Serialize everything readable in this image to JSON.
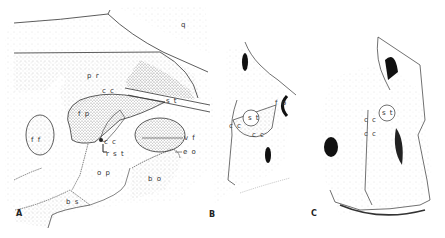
{
  "figure": {
    "panels": [
      {
        "id": "A",
        "label": "A",
        "labels": [
          {
            "text": "q",
            "x": 181,
            "y": 22
          },
          {
            "text": "p r",
            "x": 87,
            "y": 73
          },
          {
            "text": "c c",
            "x": 102,
            "y": 88
          },
          {
            "text": "s t",
            "x": 166,
            "y": 98
          },
          {
            "text": "f p",
            "x": 78,
            "y": 111
          },
          {
            "text": "f f",
            "x": 31,
            "y": 137
          },
          {
            "text": "c c",
            "x": 104,
            "y": 139
          },
          {
            "text": "r s t",
            "x": 106,
            "y": 151
          },
          {
            "text": "v f",
            "x": 184,
            "y": 135
          },
          {
            "text": "e o",
            "x": 183,
            "y": 149
          },
          {
            "text": "o p",
            "x": 97,
            "y": 170
          },
          {
            "text": "b o",
            "x": 148,
            "y": 176
          },
          {
            "text": "b s",
            "x": 66,
            "y": 199
          }
        ]
      },
      {
        "id": "B",
        "label": "B",
        "labels": [
          {
            "text": "f p",
            "x": 275,
            "y": 100
          },
          {
            "text": "s t",
            "x": 248,
            "y": 115
          },
          {
            "text": "c c",
            "x": 229,
            "y": 123
          },
          {
            "text": "c c",
            "x": 252,
            "y": 132
          }
        ]
      },
      {
        "id": "C",
        "label": "C",
        "labels": [
          {
            "text": "s t",
            "x": 386,
            "y": 111
          },
          {
            "text": "c c",
            "x": 364,
            "y": 117
          },
          {
            "text": "c c",
            "x": 364,
            "y": 131
          }
        ]
      }
    ],
    "panel_label_positions": {
      "A": {
        "x": 16,
        "y": 210
      },
      "B": {
        "x": 209,
        "y": 211
      },
      "C": {
        "x": 311,
        "y": 210
      }
    },
    "colors": {
      "ink": "#222222",
      "stipple": "#b8b8b8",
      "background": "#ffffff"
    }
  }
}
